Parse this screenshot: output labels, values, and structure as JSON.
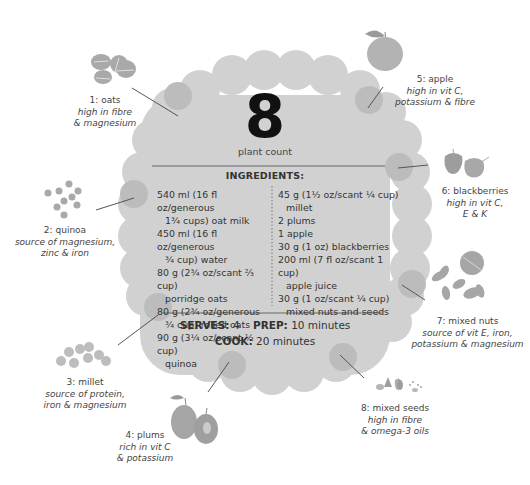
{
  "hero": {
    "count": "8",
    "count_label": "plant count"
  },
  "ingredients": {
    "title": "INGREDIENTS:",
    "left": [
      {
        "line1": "540 ml (16 fl oz/generous",
        "line2": "1¾ cups) oat milk"
      },
      {
        "line1": "450 ml (16 fl oz/generous",
        "line2": "¾ cup) water"
      },
      {
        "line1": "80 g (2¾ oz/scant ⅔ cup)",
        "line2": "porridge oats"
      },
      {
        "line1": "80 g (2¾ oz/generous",
        "line2": "¾ cup) rolled oats"
      },
      {
        "line1": "90 g (3¼ oz/scant ½ cup)",
        "line2": "quinoa"
      }
    ],
    "right": [
      {
        "line1": "45 g (1½ oz/scant ¼ cup)",
        "line2": "millet"
      },
      {
        "line1": "2 plums",
        "line2": ""
      },
      {
        "line1": "1 apple",
        "line2": ""
      },
      {
        "line1": "30 g (1 oz) blackberries",
        "line2": ""
      },
      {
        "line1": "200 ml (7 fl oz/scant 1 cup)",
        "line2": "apple juice"
      },
      {
        "line1": "30 g (1 oz/scant ¼ cup)",
        "line2": "mixed nuts and seeds"
      }
    ]
  },
  "meta": {
    "serves_label": "SERVES:",
    "serves_value": "4",
    "prep_label": "PREP:",
    "prep_value": "10 minutes",
    "cook_label": "COOK:",
    "cook_value": "20 minutes"
  },
  "plants": [
    {
      "name": "1: oats",
      "desc1": "high in fibre",
      "desc2": "& magnesium",
      "icon": "oats-icon"
    },
    {
      "name": "2: quinoa",
      "desc1": "source of magnesium,",
      "desc2": "zinc & iron",
      "icon": "quinoa-icon"
    },
    {
      "name": "3: millet",
      "desc1": "source of protein,",
      "desc2": "iron & magnesium",
      "icon": "millet-icon"
    },
    {
      "name": "4: plums",
      "desc1": "rich in vit C",
      "desc2": "& potassium",
      "icon": "plums-icon"
    },
    {
      "name": "5: apple",
      "desc1": "high in vit C,",
      "desc2": "potassium & fibre",
      "icon": "apple-icon"
    },
    {
      "name": "6: blackberries",
      "desc1": "high in vit C,",
      "desc2": "E & K",
      "icon": "blackberries-icon"
    },
    {
      "name": "7: mixed nuts",
      "desc1": "source of vit E, iron,",
      "desc2": "potassium & magnesium",
      "icon": "mixed-nuts-icon"
    },
    {
      "name": "8: mixed seeds",
      "desc1": "high in fibre",
      "desc2": "& omega-3 oils",
      "icon": "mixed-seeds-icon"
    }
  ],
  "colors": {
    "badge_fill": "#cfcfcf",
    "badge_bump": "#d3d3d3",
    "marker": "#b9b9b9",
    "icon_gray": "#a9a9a9",
    "text": "#333333"
  }
}
